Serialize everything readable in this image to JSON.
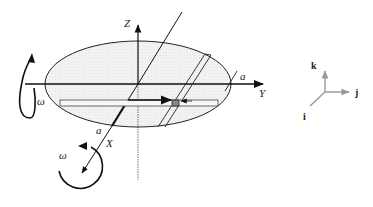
{
  "diagram": {
    "type": "rotating-disk-coordinate-frame",
    "labels": {
      "z_axis": "Z",
      "y_axis": "Y",
      "x_axis": "X",
      "a_right": "a",
      "a_lower": "a",
      "omega_left": "ω",
      "omega_bottom": "ω"
    },
    "unit_vectors": {
      "k": "k",
      "j": "j",
      "i": "i"
    },
    "colors": {
      "ellipse_fill": "#eeeeee",
      "line": "#111111",
      "triad": "#999999",
      "slider": "#888888"
    }
  }
}
